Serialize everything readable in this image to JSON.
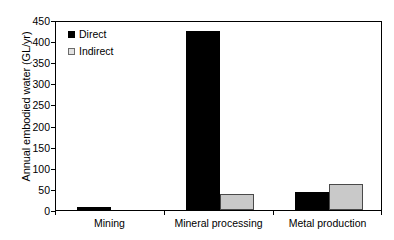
{
  "chart_data": {
    "type": "bar",
    "title": "",
    "xlabel": "",
    "ylabel": "Annual embodied water (GL/yr)",
    "categories": [
      "Mining",
      "Mineral processing",
      "Metal production"
    ],
    "series": [
      {
        "name": "Direct",
        "color": "#000000",
        "values": [
          6,
          425,
          42
        ]
      },
      {
        "name": "Indirect",
        "color": "#c9c9c9",
        "values": [
          0,
          37,
          61
        ]
      }
    ],
    "ylim": [
      0,
      450
    ],
    "ytick_values": [
      0,
      50,
      100,
      150,
      200,
      250,
      300,
      350,
      400,
      450
    ],
    "ytick_labels": [
      "0",
      "50",
      "100",
      "150",
      "200",
      "250",
      "300",
      "350",
      "400",
      "450"
    ],
    "grid": false,
    "legend_position": "upper left",
    "frame": true
  },
  "legend": {
    "items": [
      {
        "label": "Direct",
        "swatch": "filled-square-black"
      },
      {
        "label": "Indirect",
        "swatch": "outlined-square-gray"
      }
    ]
  },
  "axes": {
    "y_title": "Annual embodied water (GL/yr)"
  }
}
